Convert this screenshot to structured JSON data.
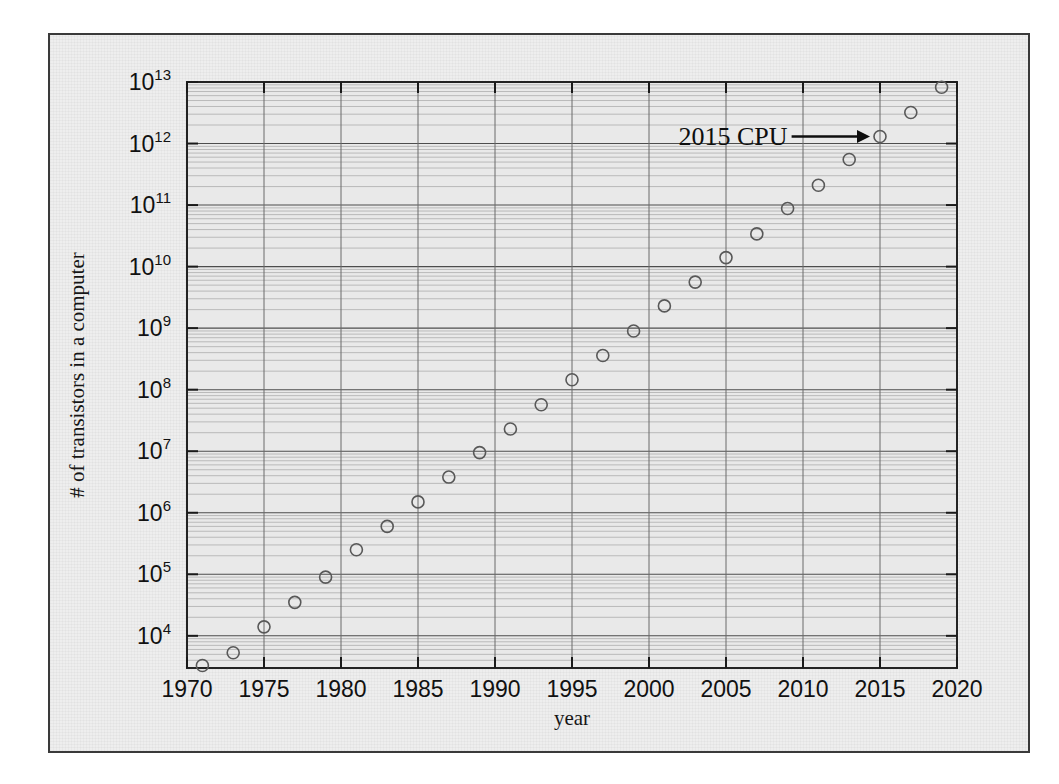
{
  "figure": {
    "background_color": "#eeeeee",
    "frame_color": "#3a3a3a",
    "page_background": "#ffffff"
  },
  "chart_data": {
    "type": "scatter",
    "title": "",
    "subtitle": "",
    "xlabel": "year",
    "ylabel": "# of transistors in a computer",
    "xlim": [
      1970,
      2020
    ],
    "ylim": [
      3000,
      10000000000000
    ],
    "yscale": "log",
    "xscale": "linear",
    "grid": true,
    "grid_minor": true,
    "legend": null,
    "legend_position": "none",
    "xticks": [
      1970,
      1975,
      1980,
      1985,
      1990,
      1995,
      2000,
      2005,
      2010,
      2015,
      2020
    ],
    "xticklabels": [
      "1970",
      "1975",
      "1980",
      "1985",
      "1990",
      "1995",
      "2000",
      "2005",
      "2010",
      "2015",
      "2020"
    ],
    "yticks": [
      10000,
      100000,
      1000000,
      10000000,
      100000000,
      1000000000,
      10000000000,
      100000000000,
      1000000000000,
      10000000000000
    ],
    "yticklabels": [
      "10⁴",
      "10⁵",
      "10⁶",
      "10⁷",
      "10⁸",
      "10⁹",
      "10¹⁰",
      "10¹¹",
      "10¹²",
      "10¹³"
    ],
    "ytick_mantissas": [
      "10",
      "10",
      "10",
      "10",
      "10",
      "10",
      "10",
      "10",
      "10",
      "10"
    ],
    "ytick_exponents": [
      "4",
      "5",
      "6",
      "7",
      "8",
      "9",
      "10",
      "11",
      "12",
      "13"
    ],
    "marker": {
      "shape": "open-circle",
      "size_px": 12,
      "edge_color": "#585858",
      "face_color": "none",
      "edge_width": 1.6
    },
    "x": [
      1971,
      1973,
      1975,
      1977,
      1979,
      1981,
      1983,
      1985,
      1987,
      1989,
      1991,
      1993,
      1995,
      1997,
      1999,
      2001,
      2003,
      2005,
      2007,
      2009,
      2011,
      2013,
      2015,
      2017,
      2019
    ],
    "values": [
      3300,
      5300,
      14000,
      35000,
      90000,
      250000,
      600000,
      1500000,
      3800000,
      9500000,
      23000000,
      57000000,
      145000000,
      360000000,
      900000000,
      2300000000,
      5600000000,
      14000000000.0,
      34000000000.0,
      88000000000.0,
      210000000000.0,
      550000000000.0,
      1300000000000.0,
      3200000000000.0,
      8200000000000.0
    ],
    "annotations": [
      {
        "text": "2015 CPU",
        "arrow": "→",
        "target_x": 2015,
        "target_y": 1300000000000.0,
        "label_x": 2009.0,
        "label_y": 2100000000000.0
      }
    ]
  }
}
